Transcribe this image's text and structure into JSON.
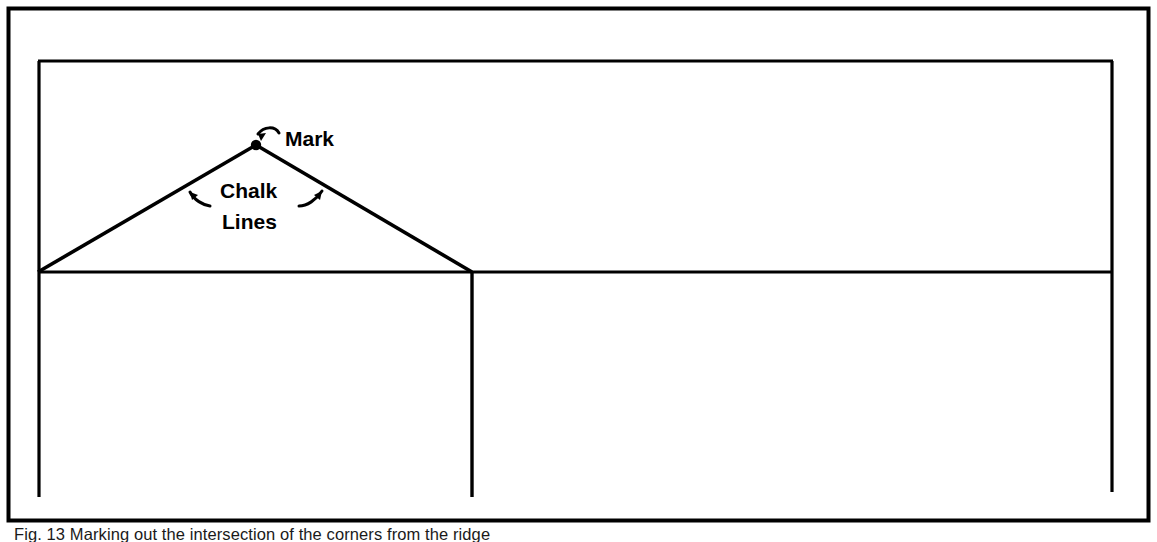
{
  "figure": {
    "caption": "Fig. 13 Marking out the intersection of the corners from the ridge",
    "ink_color": "#000000",
    "background_color": "#ffffff",
    "labels": {
      "mark": "Mark",
      "chalk": "Chalk",
      "lines": "Lines"
    },
    "geometry": {
      "outer_border": {
        "x": 8,
        "y": 8,
        "width": 1141,
        "height": 513
      },
      "inner_rect": {
        "x": 38,
        "y": 60,
        "width": 1075,
        "height": 437
      },
      "horizontal_line_y": 272,
      "apex": {
        "x": 256,
        "y": 145
      },
      "left_base": {
        "x": 38,
        "y": 272
      },
      "right_base": {
        "x": 472,
        "y": 272
      },
      "middle_vertical_x": 472,
      "vertical_bottom_y": 497
    }
  }
}
